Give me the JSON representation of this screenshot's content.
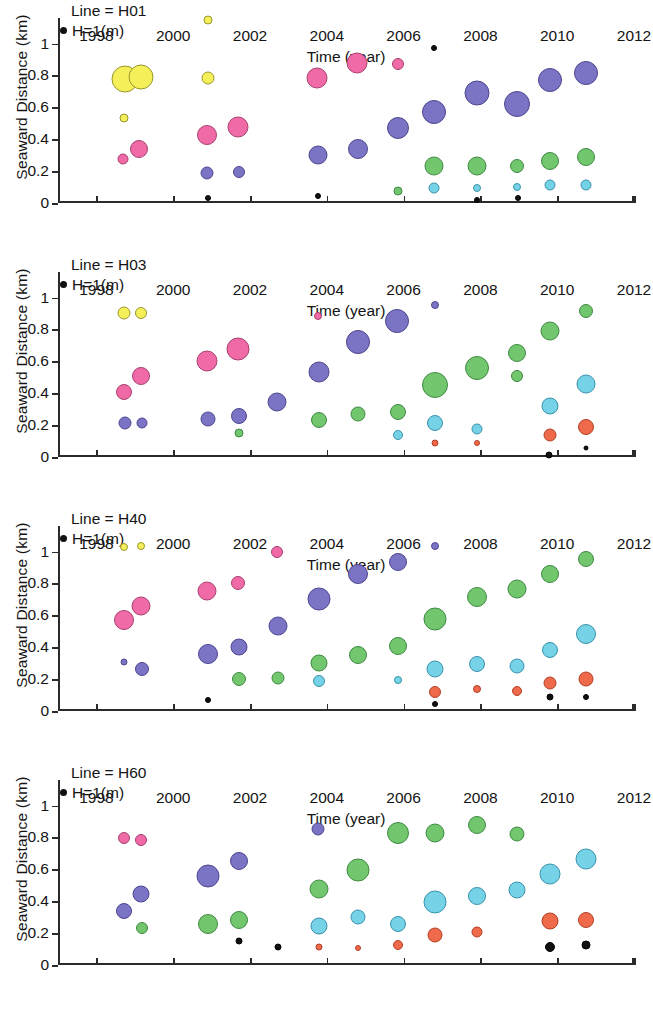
{
  "figure": {
    "xlabel": "Time (year)",
    "ylabel": "Seaward Distance (km)",
    "legend_label": "H=1(m)",
    "xticks": [
      "1998",
      "2000",
      "2002",
      "2004",
      "2006",
      "2008",
      "2010",
      "2012"
    ],
    "yticks": [
      "0",
      "0.2",
      "0.4",
      "0.6",
      "0.8",
      "1"
    ]
  },
  "colors": {
    "yellow": "#f5f05a",
    "yellow_edge": "#9a9630",
    "pink": "#f06aa8",
    "pink_edge": "#a8406e",
    "purple": "#7b73c4",
    "purple_edge": "#4d4690",
    "green": "#72c66e",
    "green_edge": "#3f8a43",
    "cyan": "#76d2e6",
    "cyan_edge": "#3a93ab",
    "orange": "#ef6a4a",
    "orange_edge": "#b23f25",
    "black": "#111111",
    "black_edge": "#000000",
    "axis": "#2b2b2b",
    "text": "#141414"
  },
  "chart_data": [
    {
      "type": "scatter",
      "title": "Line = H01",
      "xlabel": "Time (year)",
      "ylabel": "Seaward Distance (km)",
      "xlim": [
        1997,
        2012
      ],
      "ylim": [
        0,
        1.16
      ],
      "grid": false,
      "legend": "H=1(m)",
      "size_encodes": "wave height H (m), bubble area proportional to H",
      "points": [
        {
          "x": 1998.75,
          "y": 0.775,
          "r": 13.5,
          "color": "yellow"
        },
        {
          "x": 1999.15,
          "y": 0.79,
          "r": 12.5,
          "color": "yellow"
        },
        {
          "x": 2000.9,
          "y": 0.785,
          "r": 6.5,
          "color": "yellow"
        },
        {
          "x": 1998.72,
          "y": 0.535,
          "r": 4.5,
          "color": "yellow"
        },
        {
          "x": 1998.7,
          "y": 0.275,
          "r": 5.5,
          "color": "pink"
        },
        {
          "x": 1999.12,
          "y": 0.34,
          "r": 9.0,
          "color": "pink"
        },
        {
          "x": 2000.88,
          "y": 0.425,
          "r": 10.0,
          "color": "pink"
        },
        {
          "x": 2001.7,
          "y": 0.475,
          "r": 10.5,
          "color": "pink"
        },
        {
          "x": 2003.75,
          "y": 0.785,
          "r": 10.5,
          "color": "pink"
        },
        {
          "x": 2004.78,
          "y": 0.875,
          "r": 10.5,
          "color": "pink"
        },
        {
          "x": 2005.85,
          "y": 0.87,
          "r": 6.0,
          "color": "pink"
        },
        {
          "x": 2000.88,
          "y": 0.19,
          "r": 6.5,
          "color": "purple"
        },
        {
          "x": 2001.72,
          "y": 0.195,
          "r": 6.0,
          "color": "purple"
        },
        {
          "x": 2003.78,
          "y": 0.3,
          "r": 9.5,
          "color": "purple"
        },
        {
          "x": 2004.8,
          "y": 0.34,
          "r": 10.0,
          "color": "purple"
        },
        {
          "x": 2005.85,
          "y": 0.47,
          "r": 11.0,
          "color": "purple"
        },
        {
          "x": 2006.8,
          "y": 0.57,
          "r": 12.0,
          "color": "purple"
        },
        {
          "x": 2007.9,
          "y": 0.69,
          "r": 12.5,
          "color": "purple"
        },
        {
          "x": 2008.95,
          "y": 0.62,
          "r": 13.0,
          "color": "purple"
        },
        {
          "x": 2009.8,
          "y": 0.77,
          "r": 12.0,
          "color": "purple"
        },
        {
          "x": 2010.75,
          "y": 0.815,
          "r": 12.0,
          "color": "purple"
        },
        {
          "x": 2005.85,
          "y": 0.075,
          "r": 4.5,
          "color": "green"
        },
        {
          "x": 2006.8,
          "y": 0.235,
          "r": 9.5,
          "color": "green"
        },
        {
          "x": 2007.9,
          "y": 0.235,
          "r": 9.5,
          "color": "green"
        },
        {
          "x": 2008.95,
          "y": 0.235,
          "r": 7.0,
          "color": "green"
        },
        {
          "x": 2009.8,
          "y": 0.265,
          "r": 9.0,
          "color": "green"
        },
        {
          "x": 2010.75,
          "y": 0.29,
          "r": 9.0,
          "color": "green"
        },
        {
          "x": 2006.8,
          "y": 0.095,
          "r": 5.5,
          "color": "cyan"
        },
        {
          "x": 2007.9,
          "y": 0.095,
          "r": 4.0,
          "color": "cyan"
        },
        {
          "x": 2008.95,
          "y": 0.1,
          "r": 4.0,
          "color": "cyan"
        },
        {
          "x": 2009.8,
          "y": 0.115,
          "r": 5.5,
          "color": "cyan"
        },
        {
          "x": 2010.75,
          "y": 0.115,
          "r": 5.5,
          "color": "cyan"
        },
        {
          "x": 2000.9,
          "y": 0.03,
          "r": 3.0,
          "color": "black"
        },
        {
          "x": 2003.78,
          "y": 0.045,
          "r": 3.0,
          "color": "black"
        },
        {
          "x": 2006.8,
          "y": 0.975,
          "r": 3.0,
          "color": "black"
        },
        {
          "x": 2007.92,
          "y": 0.02,
          "r": 3.0,
          "color": "black"
        },
        {
          "x": 2008.98,
          "y": 0.03,
          "r": 3.0,
          "color": "black"
        },
        {
          "x": 2000.9,
          "y": 1.145,
          "r": 4.5,
          "color": "yellow"
        }
      ]
    },
    {
      "type": "scatter",
      "title": "Line = H03",
      "xlabel": "Time (year)",
      "ylabel": "Seaward Distance (km)",
      "xlim": [
        1997,
        2012
      ],
      "ylim": [
        0,
        1.16
      ],
      "grid": false,
      "legend": "H=1(m)",
      "size_encodes": "wave height H (m), bubble area proportional to H",
      "points": [
        {
          "x": 1998.72,
          "y": 0.9,
          "r": 6.5,
          "color": "yellow"
        },
        {
          "x": 1999.15,
          "y": 0.905,
          "r": 6.0,
          "color": "yellow"
        },
        {
          "x": 1998.72,
          "y": 0.41,
          "r": 8.0,
          "color": "pink"
        },
        {
          "x": 1999.15,
          "y": 0.505,
          "r": 9.0,
          "color": "pink"
        },
        {
          "x": 2000.88,
          "y": 0.6,
          "r": 10.5,
          "color": "pink"
        },
        {
          "x": 2001.7,
          "y": 0.68,
          "r": 11.5,
          "color": "pink"
        },
        {
          "x": 2003.78,
          "y": 0.885,
          "r": 4.0,
          "color": "pink"
        },
        {
          "x": 1998.75,
          "y": 0.215,
          "r": 6.5,
          "color": "purple"
        },
        {
          "x": 1999.18,
          "y": 0.215,
          "r": 5.5,
          "color": "purple"
        },
        {
          "x": 2000.9,
          "y": 0.24,
          "r": 7.5,
          "color": "purple"
        },
        {
          "x": 2001.72,
          "y": 0.26,
          "r": 8.0,
          "color": "purple"
        },
        {
          "x": 2002.7,
          "y": 0.345,
          "r": 9.5,
          "color": "purple"
        },
        {
          "x": 2003.8,
          "y": 0.535,
          "r": 10.5,
          "color": "purple"
        },
        {
          "x": 2004.8,
          "y": 0.72,
          "r": 12.0,
          "color": "purple"
        },
        {
          "x": 2005.82,
          "y": 0.85,
          "r": 12.0,
          "color": "purple"
        },
        {
          "x": 2006.82,
          "y": 0.955,
          "r": 4.0,
          "color": "purple"
        },
        {
          "x": 2001.72,
          "y": 0.15,
          "r": 4.5,
          "color": "green"
        },
        {
          "x": 2003.8,
          "y": 0.235,
          "r": 8.0,
          "color": "green"
        },
        {
          "x": 2004.82,
          "y": 0.27,
          "r": 7.5,
          "color": "green"
        },
        {
          "x": 2005.85,
          "y": 0.285,
          "r": 8.0,
          "color": "green"
        },
        {
          "x": 2006.82,
          "y": 0.45,
          "r": 13.0,
          "color": "green"
        },
        {
          "x": 2007.9,
          "y": 0.555,
          "r": 12.0,
          "color": "green"
        },
        {
          "x": 2008.95,
          "y": 0.65,
          "r": 9.0,
          "color": "green"
        },
        {
          "x": 2009.8,
          "y": 0.79,
          "r": 9.5,
          "color": "green"
        },
        {
          "x": 2010.75,
          "y": 0.915,
          "r": 7.0,
          "color": "green"
        },
        {
          "x": 2008.95,
          "y": 0.505,
          "r": 6.0,
          "color": "green"
        },
        {
          "x": 2005.85,
          "y": 0.14,
          "r": 5.0,
          "color": "cyan"
        },
        {
          "x": 2006.82,
          "y": 0.215,
          "r": 8.0,
          "color": "cyan"
        },
        {
          "x": 2007.9,
          "y": 0.175,
          "r": 5.5,
          "color": "cyan"
        },
        {
          "x": 2009.8,
          "y": 0.32,
          "r": 8.5,
          "color": "cyan"
        },
        {
          "x": 2010.75,
          "y": 0.455,
          "r": 9.5,
          "color": "cyan"
        },
        {
          "x": 2006.82,
          "y": 0.085,
          "r": 3.5,
          "color": "orange"
        },
        {
          "x": 2007.92,
          "y": 0.085,
          "r": 3.0,
          "color": "orange"
        },
        {
          "x": 2009.8,
          "y": 0.135,
          "r": 6.5,
          "color": "orange"
        },
        {
          "x": 2010.75,
          "y": 0.19,
          "r": 8.0,
          "color": "orange"
        },
        {
          "x": 2009.78,
          "y": 0.015,
          "r": 3.5,
          "color": "black"
        },
        {
          "x": 2010.75,
          "y": 0.055,
          "r": 2.5,
          "color": "black"
        }
      ]
    },
    {
      "type": "scatter",
      "title": "Line = H40",
      "xlabel": "Time (year)",
      "ylabel": "Seaward Distance (km)",
      "xlim": [
        1997,
        2012
      ],
      "ylim": [
        0,
        1.16
      ],
      "grid": false,
      "legend": "H=1(m)",
      "size_encodes": "wave height H (m), bubble area proportional to H",
      "points": [
        {
          "x": 1998.72,
          "y": 1.03,
          "r": 4.0,
          "color": "yellow"
        },
        {
          "x": 1999.15,
          "y": 1.035,
          "r": 4.0,
          "color": "yellow"
        },
        {
          "x": 1998.72,
          "y": 0.57,
          "r": 10.0,
          "color": "pink"
        },
        {
          "x": 1999.15,
          "y": 0.66,
          "r": 9.5,
          "color": "pink"
        },
        {
          "x": 2000.88,
          "y": 0.75,
          "r": 9.5,
          "color": "pink"
        },
        {
          "x": 2001.7,
          "y": 0.8,
          "r": 7.0,
          "color": "pink"
        },
        {
          "x": 2002.7,
          "y": 1.0,
          "r": 6.0,
          "color": "pink"
        },
        {
          "x": 1998.72,
          "y": 0.305,
          "r": 3.5,
          "color": "purple"
        },
        {
          "x": 1999.18,
          "y": 0.265,
          "r": 7.0,
          "color": "purple"
        },
        {
          "x": 2000.9,
          "y": 0.355,
          "r": 10.0,
          "color": "purple"
        },
        {
          "x": 2001.72,
          "y": 0.4,
          "r": 8.5,
          "color": "purple"
        },
        {
          "x": 2002.72,
          "y": 0.53,
          "r": 9.5,
          "color": "purple"
        },
        {
          "x": 2003.8,
          "y": 0.705,
          "r": 11.5,
          "color": "purple"
        },
        {
          "x": 2004.82,
          "y": 0.86,
          "r": 10.0,
          "color": "purple"
        },
        {
          "x": 2005.85,
          "y": 0.935,
          "r": 9.0,
          "color": "purple"
        },
        {
          "x": 2006.82,
          "y": 1.035,
          "r": 4.0,
          "color": "purple"
        },
        {
          "x": 2001.72,
          "y": 0.2,
          "r": 7.0,
          "color": "green"
        },
        {
          "x": 2002.72,
          "y": 0.21,
          "r": 6.5,
          "color": "green"
        },
        {
          "x": 2003.8,
          "y": 0.3,
          "r": 8.5,
          "color": "green"
        },
        {
          "x": 2004.82,
          "y": 0.35,
          "r": 9.0,
          "color": "green"
        },
        {
          "x": 2005.85,
          "y": 0.41,
          "r": 9.0,
          "color": "green"
        },
        {
          "x": 2006.82,
          "y": 0.58,
          "r": 11.5,
          "color": "green"
        },
        {
          "x": 2007.9,
          "y": 0.715,
          "r": 10.0,
          "color": "green"
        },
        {
          "x": 2008.95,
          "y": 0.765,
          "r": 9.5,
          "color": "green"
        },
        {
          "x": 2009.8,
          "y": 0.86,
          "r": 9.0,
          "color": "green"
        },
        {
          "x": 2010.75,
          "y": 0.955,
          "r": 8.0,
          "color": "green"
        },
        {
          "x": 2003.8,
          "y": 0.19,
          "r": 6.0,
          "color": "cyan"
        },
        {
          "x": 2005.85,
          "y": 0.195,
          "r": 4.0,
          "color": "cyan"
        },
        {
          "x": 2006.82,
          "y": 0.265,
          "r": 8.5,
          "color": "cyan"
        },
        {
          "x": 2007.9,
          "y": 0.295,
          "r": 8.0,
          "color": "cyan"
        },
        {
          "x": 2008.95,
          "y": 0.285,
          "r": 7.5,
          "color": "cyan"
        },
        {
          "x": 2009.8,
          "y": 0.38,
          "r": 8.0,
          "color": "cyan"
        },
        {
          "x": 2010.75,
          "y": 0.48,
          "r": 10.0,
          "color": "cyan"
        },
        {
          "x": 2006.82,
          "y": 0.12,
          "r": 6.0,
          "color": "orange"
        },
        {
          "x": 2007.92,
          "y": 0.135,
          "r": 4.0,
          "color": "orange"
        },
        {
          "x": 2008.95,
          "y": 0.125,
          "r": 5.0,
          "color": "orange"
        },
        {
          "x": 2009.8,
          "y": 0.175,
          "r": 6.5,
          "color": "orange"
        },
        {
          "x": 2010.75,
          "y": 0.2,
          "r": 7.5,
          "color": "orange"
        },
        {
          "x": 2000.9,
          "y": 0.07,
          "r": 3.0,
          "color": "black"
        },
        {
          "x": 2006.82,
          "y": 0.045,
          "r": 3.0,
          "color": "black"
        },
        {
          "x": 2009.8,
          "y": 0.085,
          "r": 3.5,
          "color": "black"
        },
        {
          "x": 2010.75,
          "y": 0.09,
          "r": 3.0,
          "color": "black"
        }
      ]
    },
    {
      "type": "scatter",
      "title": "Line = H60",
      "xlabel": "Time (year)",
      "ylabel": "Seaward Distance (km)",
      "xlim": [
        1997,
        2012
      ],
      "ylim": [
        0,
        1.16
      ],
      "grid": false,
      "legend": "H=1(m)",
      "size_encodes": "wave height H (m), bubble area proportional to H",
      "points": [
        {
          "x": 1998.72,
          "y": 0.795,
          "r": 6.0,
          "color": "pink"
        },
        {
          "x": 1999.15,
          "y": 0.785,
          "r": 6.0,
          "color": "pink"
        },
        {
          "x": 1998.72,
          "y": 0.34,
          "r": 8.0,
          "color": "purple"
        },
        {
          "x": 1999.15,
          "y": 0.445,
          "r": 8.5,
          "color": "purple"
        },
        {
          "x": 2000.9,
          "y": 0.56,
          "r": 11.5,
          "color": "purple"
        },
        {
          "x": 2001.72,
          "y": 0.65,
          "r": 9.0,
          "color": "purple"
        },
        {
          "x": 2003.78,
          "y": 0.85,
          "r": 6.5,
          "color": "purple"
        },
        {
          "x": 1999.18,
          "y": 0.23,
          "r": 6.0,
          "color": "green"
        },
        {
          "x": 2000.9,
          "y": 0.255,
          "r": 10.0,
          "color": "green"
        },
        {
          "x": 2001.72,
          "y": 0.285,
          "r": 9.0,
          "color": "green"
        },
        {
          "x": 2003.8,
          "y": 0.475,
          "r": 9.5,
          "color": "green"
        },
        {
          "x": 2004.82,
          "y": 0.595,
          "r": 11.5,
          "color": "green"
        },
        {
          "x": 2005.85,
          "y": 0.825,
          "r": 11.0,
          "color": "green"
        },
        {
          "x": 2006.82,
          "y": 0.825,
          "r": 9.5,
          "color": "green"
        },
        {
          "x": 2007.9,
          "y": 0.875,
          "r": 9.0,
          "color": "green"
        },
        {
          "x": 2008.95,
          "y": 0.82,
          "r": 7.5,
          "color": "green"
        },
        {
          "x": 2003.8,
          "y": 0.245,
          "r": 8.5,
          "color": "cyan"
        },
        {
          "x": 2004.82,
          "y": 0.3,
          "r": 7.5,
          "color": "cyan"
        },
        {
          "x": 2005.85,
          "y": 0.26,
          "r": 8.0,
          "color": "cyan"
        },
        {
          "x": 2006.82,
          "y": 0.395,
          "r": 11.5,
          "color": "cyan"
        },
        {
          "x": 2007.9,
          "y": 0.43,
          "r": 9.0,
          "color": "cyan"
        },
        {
          "x": 2008.95,
          "y": 0.47,
          "r": 8.5,
          "color": "cyan"
        },
        {
          "x": 2009.8,
          "y": 0.57,
          "r": 10.5,
          "color": "cyan"
        },
        {
          "x": 2010.75,
          "y": 0.665,
          "r": 10.5,
          "color": "cyan"
        },
        {
          "x": 2003.8,
          "y": 0.11,
          "r": 3.5,
          "color": "orange"
        },
        {
          "x": 2004.82,
          "y": 0.105,
          "r": 3.0,
          "color": "orange"
        },
        {
          "x": 2005.85,
          "y": 0.125,
          "r": 5.0,
          "color": "orange"
        },
        {
          "x": 2006.82,
          "y": 0.19,
          "r": 7.5,
          "color": "orange"
        },
        {
          "x": 2007.92,
          "y": 0.21,
          "r": 5.5,
          "color": "orange"
        },
        {
          "x": 2009.8,
          "y": 0.275,
          "r": 8.5,
          "color": "orange"
        },
        {
          "x": 2010.75,
          "y": 0.285,
          "r": 8.0,
          "color": "orange"
        },
        {
          "x": 2001.72,
          "y": 0.15,
          "r": 3.5,
          "color": "black"
        },
        {
          "x": 2002.72,
          "y": 0.11,
          "r": 3.5,
          "color": "black"
        },
        {
          "x": 2009.8,
          "y": 0.115,
          "r": 5.0,
          "color": "black"
        },
        {
          "x": 2010.75,
          "y": 0.125,
          "r": 4.5,
          "color": "black"
        }
      ]
    }
  ]
}
